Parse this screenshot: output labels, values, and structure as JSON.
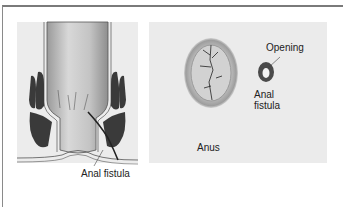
{
  "figure": {
    "left_panel": {
      "title": "Cross-section of rectum and anal canal",
      "label": "Anal fistula"
    },
    "right_panel": {
      "title": "External view",
      "labels": {
        "anus": "Anus",
        "opening": "Opening",
        "fistula_line1": "Anal",
        "fistula_line2": "fistula"
      }
    },
    "colors": {
      "panel_bg": "#ececec",
      "muscle": "#3a3a3a",
      "tissue": "#c8c8c8",
      "fistula_ring": "#4a4a4a"
    }
  }
}
